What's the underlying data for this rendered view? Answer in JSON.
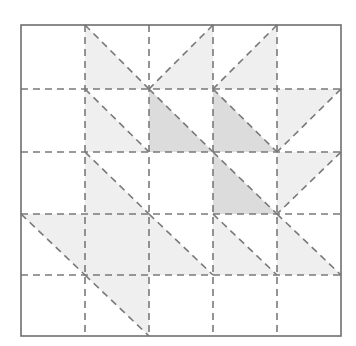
{
  "diagram": {
    "title": "",
    "type": "quilt-block-grid",
    "rows": 5,
    "cols": 5,
    "origin": [
      21,
      25
    ],
    "col_edges": [
      21,
      85,
      149,
      213,
      277,
      341
    ],
    "row_edges": [
      25,
      89,
      152,
      214,
      275,
      336
    ],
    "colors": {
      "background": "#ffffff",
      "border": "#6e6e6e",
      "dash": "#7a7a7a",
      "light_fill": "#efefef",
      "dark_fill": "#dcdcdc"
    },
    "cells": [
      {
        "row": 0,
        "col": 1,
        "shape": "bottom-left",
        "shade": "light"
      },
      {
        "row": 0,
        "col": 2,
        "shape": "bottom-right",
        "shade": "light"
      },
      {
        "row": 0,
        "col": 3,
        "shape": "bottom-right",
        "shade": "light"
      },
      {
        "row": 1,
        "col": 1,
        "shape": "bottom-left",
        "shade": "light"
      },
      {
        "row": 1,
        "col": 2,
        "shape": "bottom-left",
        "shade": "dark"
      },
      {
        "row": 1,
        "col": 3,
        "shape": "bottom-left",
        "shade": "dark"
      },
      {
        "row": 1,
        "col": 4,
        "shape": "top-left",
        "shade": "light"
      },
      {
        "row": 2,
        "col": 1,
        "shape": "bottom-left",
        "shade": "light"
      },
      {
        "row": 2,
        "col": 3,
        "shape": "bottom-left",
        "shade": "dark"
      },
      {
        "row": 2,
        "col": 4,
        "shape": "top-left",
        "shade": "light"
      },
      {
        "row": 3,
        "col": 0,
        "shape": "top-right",
        "shade": "light"
      },
      {
        "row": 3,
        "col": 1,
        "shape": "full",
        "shade": "light"
      },
      {
        "row": 3,
        "col": 2,
        "shape": "bottom-left",
        "shade": "light"
      },
      {
        "row": 3,
        "col": 3,
        "shape": "bottom-left",
        "shade": "light"
      },
      {
        "row": 3,
        "col": 4,
        "shape": "bottom-left",
        "shade": "light"
      },
      {
        "row": 4,
        "col": 1,
        "shape": "top-right",
        "shade": "light"
      }
    ]
  }
}
